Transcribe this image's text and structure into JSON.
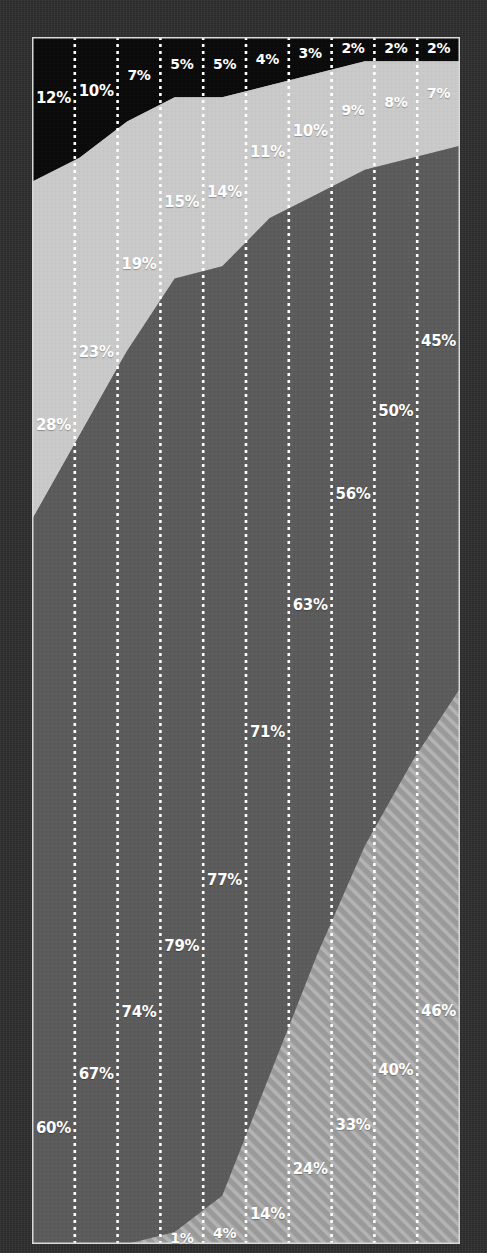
{
  "chart_data": {
    "type": "area",
    "title": "",
    "subtitle": "",
    "xlabel": "",
    "ylabel": "",
    "ylim": [
      0,
      100
    ],
    "grid": false,
    "legend_position": "none",
    "stacked": true,
    "normalized_percent": true,
    "categories": [
      "1",
      "2",
      "3",
      "4",
      "5",
      "6",
      "7",
      "8",
      "9",
      "10"
    ],
    "series": [
      {
        "name": "series-black",
        "fill": "#0b0b0b",
        "pattern": "solid",
        "label_color": "#ffffff",
        "values": [
          12,
          10,
          7,
          5,
          5,
          4,
          3,
          2,
          2,
          2
        ],
        "labels": [
          "12%",
          "10%",
          "7%",
          "5%",
          "5%",
          "4%",
          "3%",
          "2%",
          "2%",
          "2%"
        ]
      },
      {
        "name": "series-light-gray",
        "fill": "#c9c9c9",
        "pattern": "solid",
        "label_color": "#ffffff",
        "values": [
          28,
          23,
          19,
          15,
          14,
          11,
          10,
          9,
          8,
          7
        ],
        "labels": [
          "28%",
          "23%",
          "19%",
          "15%",
          "14%",
          "11%",
          "10%",
          "9%",
          "8%",
          "7%"
        ]
      },
      {
        "name": "series-dark-gray",
        "fill": "#5b5b5b",
        "pattern": "solid",
        "label_color": "#ffffff",
        "values": [
          60,
          67,
          74,
          79,
          77,
          71,
          63,
          56,
          50,
          45
        ],
        "labels": [
          "60%",
          "67%",
          "74%",
          "79%",
          "77%",
          "71%",
          "63%",
          "56%",
          "50%",
          "45%"
        ]
      },
      {
        "name": "series-hatched",
        "fill": "#9b9b9b",
        "pattern": "diagonal-stripes",
        "label_color": "#ffffff",
        "values": [
          0,
          0,
          0,
          1,
          4,
          14,
          24,
          33,
          40,
          46
        ],
        "labels": [
          "",
          "",
          "",
          "1%",
          "4%",
          "14%",
          "24%",
          "33%",
          "40%",
          "46%"
        ]
      }
    ],
    "colors": {
      "background": "#2e2e2e",
      "plot_border": "#d9d9d9",
      "divider": "#ffffff",
      "black_band": "#0b0b0b",
      "light_gray_band": "#c9c9c9",
      "dark_gray_band": "#5b5b5b",
      "hatched_band": "#9b9b9b",
      "label_text": "#ffffff"
    },
    "dividers": {
      "style": "dotted",
      "color": "#ffffff",
      "count": 9
    }
  }
}
